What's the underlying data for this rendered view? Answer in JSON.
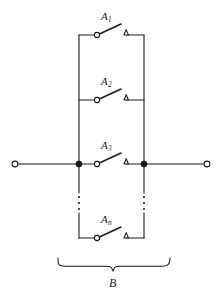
{
  "figure": {
    "kind": "circuit-diagram",
    "line_color": "#1a1a1a",
    "background_color": "#ffffff"
  },
  "geometry": {
    "left_rail_x": 79,
    "right_rail_x": 144,
    "main_line_y": 164,
    "left_terminal_x": 15,
    "right_terminal_x": 207,
    "rail_top_y": 35,
    "rail_bottom_y": 238,
    "brace_left_x": 58,
    "brace_right_x": 170,
    "brace_y": 266
  },
  "terminals": [
    {
      "name": "left-terminal",
      "x": 15,
      "y": 164,
      "r": 3
    },
    {
      "name": "right-terminal",
      "x": 207,
      "y": 164,
      "r": 3
    }
  ],
  "junctions": [
    {
      "name": "left-junction",
      "x": 79,
      "y": 164,
      "r": 3.2
    },
    {
      "name": "right-junction",
      "x": 144,
      "y": 164,
      "r": 3.2
    }
  ],
  "switches": [
    {
      "id": "A1",
      "label": "A",
      "subscript": "1",
      "y": 35,
      "pivot_x": 97,
      "contact_x": 124,
      "blade_tip_x": 121,
      "blade_tip_y": 24,
      "label_x": 103,
      "label_y": 12
    },
    {
      "id": "A2",
      "label": "A",
      "subscript": "2",
      "y": 100,
      "pivot_x": 97,
      "contact_x": 124,
      "blade_tip_x": 121,
      "blade_tip_y": 89,
      "label_x": 103,
      "label_y": 77
    },
    {
      "id": "A3",
      "label": "A",
      "subscript": "3",
      "y": 164,
      "pivot_x": 97,
      "contact_x": 124,
      "blade_tip_x": 121,
      "blade_tip_y": 153,
      "label_x": 103,
      "label_y": 141
    },
    {
      "id": "An",
      "label": "A",
      "subscript": "n",
      "y": 238,
      "pivot_x": 97,
      "contact_x": 124,
      "blade_tip_x": 121,
      "blade_tip_y": 227,
      "label_x": 103,
      "label_y": 215
    }
  ],
  "ellipsis": [
    {
      "name": "left-rail-ellipsis",
      "x": 79,
      "ys": [
        197,
        203,
        209
      ]
    },
    {
      "name": "right-rail-ellipsis",
      "x": 144,
      "ys": [
        197,
        203,
        209
      ]
    }
  ],
  "brace": {
    "name": "B",
    "label": "B",
    "label_x": 113,
    "label_y": 276
  }
}
